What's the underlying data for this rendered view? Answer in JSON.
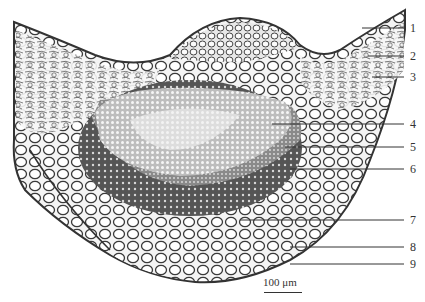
{
  "figure": {
    "type": "micrograph",
    "scale_bar": {
      "label": "100 μm"
    },
    "labels": [
      {
        "num": "1",
        "y": 28,
        "x1": 362
      },
      {
        "num": "2",
        "y": 56,
        "x1": 368
      },
      {
        "num": "3",
        "y": 77,
        "x1": 372
      },
      {
        "num": "4",
        "y": 124,
        "x1": 272
      },
      {
        "num": "5",
        "y": 147,
        "x1": 285
      },
      {
        "num": "6",
        "y": 169,
        "x1": 290
      },
      {
        "num": "7",
        "y": 220,
        "x1": 240
      },
      {
        "num": "8",
        "y": 247,
        "x1": 290
      },
      {
        "num": "9",
        "y": 264,
        "x1": 290
      }
    ]
  }
}
